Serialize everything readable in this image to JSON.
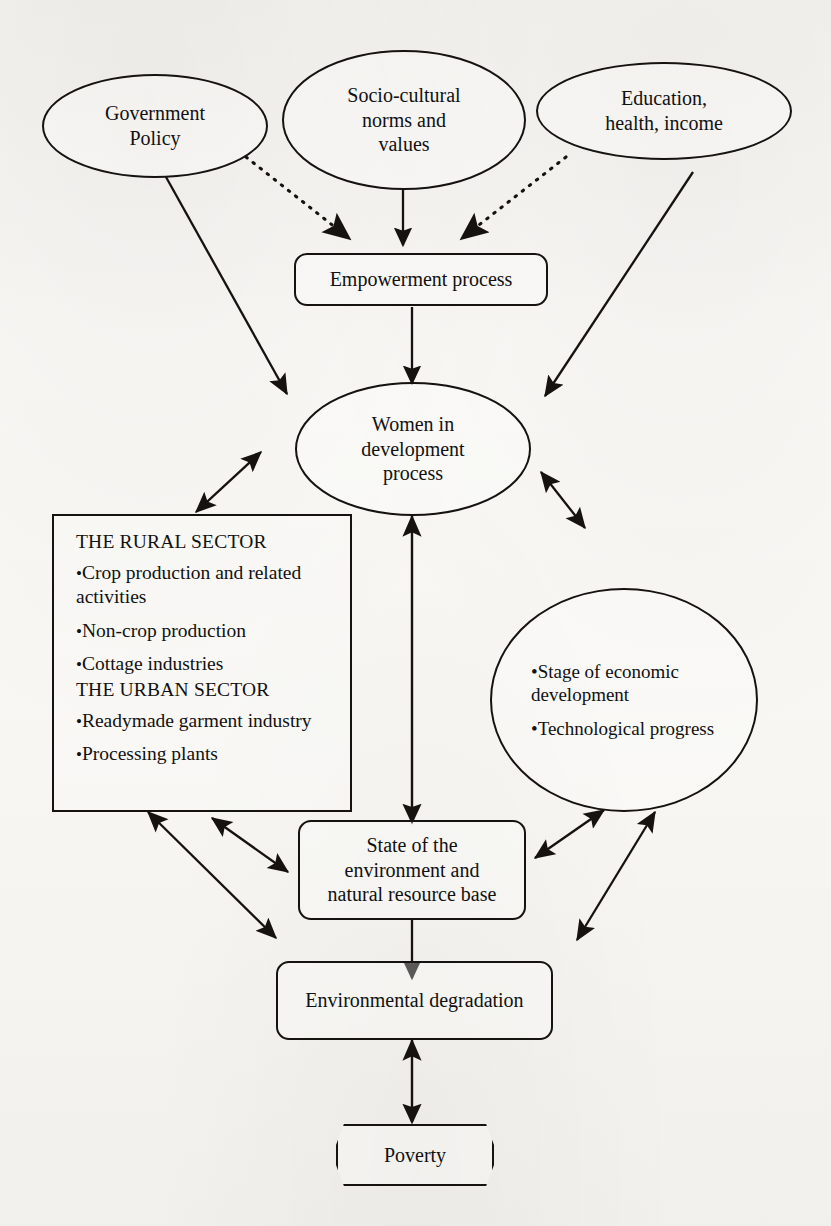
{
  "diagram": {
    "background_color": "#f7f6f3",
    "line_color": "#15120f",
    "nodes": {
      "government_policy": {
        "label": "Government\nPolicy",
        "shape": "ellipse"
      },
      "socio_cultural": {
        "label": "Socio-cultural\nnorms and\nvalues",
        "shape": "ellipse"
      },
      "education_health_income": {
        "label": "Education,\nhealth, income",
        "shape": "ellipse"
      },
      "empowerment_process": {
        "label": "Empowerment process",
        "shape": "rounded-rectangle"
      },
      "women_in_development": {
        "label": "Women in\ndevelopment\nprocess",
        "shape": "ellipse"
      },
      "sector_box": {
        "shape": "rectangle",
        "rural_heading": "THE RURAL SECTOR",
        "rural_items": [
          "Crop production and related activities",
          "Non-crop production",
          "Cottage industries"
        ],
        "urban_heading": "THE URBAN SECTOR",
        "urban_items": [
          "Readymade garment industry",
          "Processing plants"
        ],
        "bullet_glyph": "•"
      },
      "economic_ellipse": {
        "shape": "ellipse",
        "items": [
          "Stage of economic development",
          "Technological progress"
        ],
        "bullet_glyph": "•"
      },
      "state_of_environment": {
        "label": "State of the\nenvironment and\nnatural resource base",
        "shape": "rounded-rectangle"
      },
      "environmental_degradation": {
        "label": "Environmental degradation",
        "shape": "rounded-rectangle"
      },
      "poverty": {
        "label": "Poverty",
        "shape": "octagon"
      }
    },
    "edges": [
      {
        "from": "government_policy",
        "to": "empowerment_process",
        "style": "dotted",
        "heads": "single"
      },
      {
        "from": "socio_cultural",
        "to": "empowerment_process",
        "style": "solid",
        "heads": "single"
      },
      {
        "from": "education_health_income",
        "to": "empowerment_process",
        "style": "dotted",
        "heads": "single"
      },
      {
        "from": "government_policy",
        "to": "women_in_development",
        "style": "solid",
        "heads": "single"
      },
      {
        "from": "education_health_income",
        "to": "women_in_development",
        "style": "solid",
        "heads": "single"
      },
      {
        "from": "empowerment_process",
        "to": "women_in_development",
        "style": "solid",
        "heads": "single"
      },
      {
        "from": "women_in_development",
        "to": "sector_box",
        "style": "solid",
        "heads": "double"
      },
      {
        "from": "women_in_development",
        "to": "economic_ellipse",
        "style": "solid",
        "heads": "double"
      },
      {
        "from": "women_in_development",
        "to": "state_of_environment",
        "style": "solid",
        "heads": "double"
      },
      {
        "from": "sector_box",
        "to": "state_of_environment",
        "style": "solid",
        "heads": "double"
      },
      {
        "from": "sector_box",
        "to": "environmental_degradation",
        "style": "solid",
        "heads": "double"
      },
      {
        "from": "economic_ellipse",
        "to": "state_of_environment",
        "style": "solid",
        "heads": "double"
      },
      {
        "from": "economic_ellipse",
        "to": "environmental_degradation",
        "style": "solid",
        "heads": "double"
      },
      {
        "from": "state_of_environment",
        "to": "environmental_degradation",
        "style": "solid",
        "heads": "single"
      },
      {
        "from": "environmental_degradation",
        "to": "poverty",
        "style": "solid",
        "heads": "double"
      }
    ]
  }
}
